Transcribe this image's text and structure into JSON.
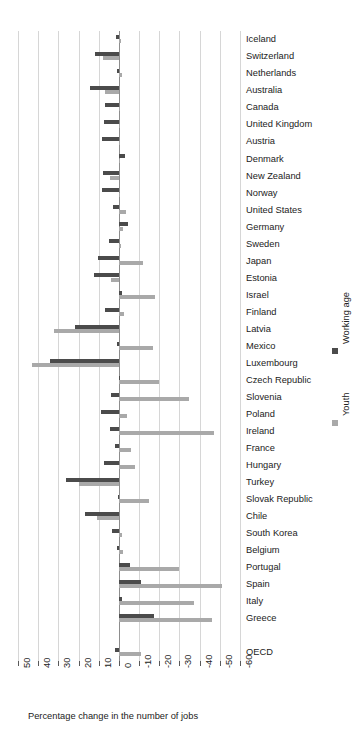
{
  "chart_data": {
    "type": "bar",
    "orientation": "horizontal",
    "title": "",
    "subtitle": "",
    "xlabel": "Percentage change in the number of jobs",
    "ylabel": "",
    "xlim": [
      50,
      -60
    ],
    "xticks": [
      50,
      40,
      30,
      20,
      10,
      0,
      -10,
      -20,
      -30,
      -40,
      -50,
      -60
    ],
    "xticklabels": [
      "50",
      "40",
      "30",
      "20",
      "10",
      "0",
      "-10",
      "-20",
      "-30",
      "-40",
      "-50",
      "-60"
    ],
    "axis_direction": "reversed",
    "grid": true,
    "grid_axis": "x",
    "legend_position": "right-outside-rotated",
    "categories": [
      "Iceland",
      "Switzerland",
      "Netherlands",
      "Australia",
      "Canada",
      "United Kingdom",
      "Austria",
      "Denmark",
      "New Zealand",
      "Norway",
      "United States",
      "Germany",
      "Sweden",
      "Japan",
      "Estonia",
      "Israel",
      "Finland",
      "Latvia",
      "Mexico",
      "Luxembourg",
      "Czech Republic",
      "Slovenia",
      "Poland",
      "Ireland",
      "France",
      "Hungary",
      "Turkey",
      "Slovak Republic",
      "Chile",
      " South Korea",
      "Belgium",
      "Portugal",
      "Spain",
      "Italy",
      "Greece",
      "",
      "OECD"
    ],
    "series": [
      {
        "name": "Working age",
        "color": "#4b4b4b",
        "values": [
          1.5,
          12.0,
          0.8,
          14.5,
          7.0,
          7.5,
          8.5,
          -3.0,
          8.0,
          8.5,
          3.0,
          -4.5,
          5.0,
          10.5,
          12.5,
          -1.5,
          7.0,
          22.0,
          1.0,
          34.0,
          -0.5,
          4.0,
          9.0,
          4.5,
          2.0,
          7.5,
          26.0,
          0.5,
          17.0,
          3.5,
          1.0,
          -5.5,
          -11.0,
          -1.5,
          -17.5,
          null,
          2.0
        ]
      },
      {
        "name": "Youth",
        "color": "#a9a9a9",
        "values": [
          -1.0,
          8.0,
          -1.5,
          7.0,
          -0.5,
          0.0,
          0.0,
          0.0,
          4.5,
          0.0,
          -3.5,
          -2.0,
          -1.0,
          -12.0,
          4.0,
          -18.0,
          -2.5,
          32.0,
          -17.0,
          43.0,
          -20.0,
          -34.5,
          -4.0,
          -47.0,
          -6.0,
          -8.0,
          20.0,
          -15.0,
          11.0,
          -1.5,
          -2.0,
          -30.0,
          -51.0,
          -37.0,
          -46.0,
          null,
          -11.0
        ]
      }
    ]
  },
  "legend": {
    "items": [
      {
        "label": "Working age",
        "color": "#4b4b4b"
      },
      {
        "label": "Youth",
        "color": "#a9a9a9"
      }
    ]
  },
  "colors": {
    "working_age": "#4b4b4b",
    "youth": "#a9a9a9",
    "gridline": "#d6d6d6",
    "zero_line": "#8d8d8d",
    "text": "#222222",
    "background": "#ffffff"
  }
}
